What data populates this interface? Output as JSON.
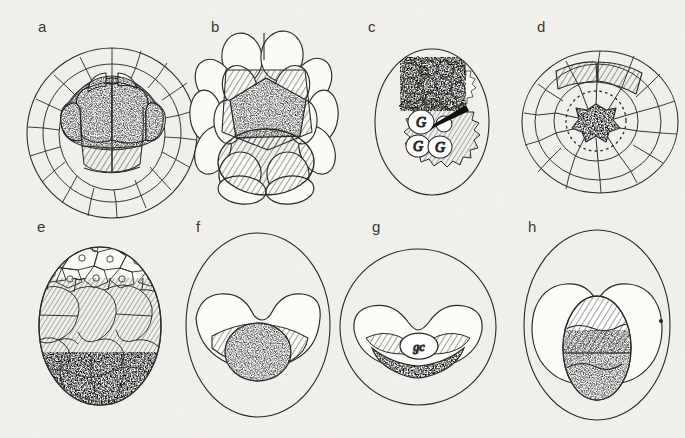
{
  "figure": {
    "background_color": "#f2f0ec",
    "ink_color": "#2b2926",
    "panels": [
      {
        "id": "a",
        "label": "a",
        "label_x": 38,
        "label_y": 32,
        "view": "whole blastula, lateral view",
        "shape": "sphere",
        "cx": 112,
        "cy": 133,
        "rx": 86,
        "ry": 84,
        "features": [
          "outer polygonal blastomere layer",
          "inner stippled cell mass",
          "two hatched cells at base of inner mass"
        ]
      },
      {
        "id": "b",
        "label": "b",
        "label_x": 211,
        "label_y": 32,
        "view": "early cleavage, larger blastomeres",
        "shape": "sphere",
        "cx": 266,
        "cy": 115,
        "rx": 66,
        "ry": 72,
        "features": [
          "ring of large oval blastomeres",
          "hatched inner quadrangle",
          "stippled pentagonal cell",
          "large hatched basal cell"
        ]
      },
      {
        "id": "c",
        "label": "c",
        "label_x": 368,
        "label_y": 32,
        "view": "germ cell cluster within ovoid embryo",
        "shape": "ovoid",
        "cx": 432,
        "cy": 122,
        "rx": 58,
        "ry": 74,
        "features": [
          "spiky hatched cell cluster",
          "stippled upper cells",
          "black arrow indicator"
        ],
        "cell_labels": [
          {
            "text": "G",
            "x": 421,
            "y": 122
          },
          {
            "text": "G",
            "x": 418,
            "y": 145
          },
          {
            "text": "G",
            "x": 438,
            "y": 147
          }
        ],
        "arrow": {
          "x1": 464,
          "y1": 108,
          "x2": 428,
          "y2": 127
        }
      },
      {
        "id": "d",
        "label": "d",
        "label_x": 537,
        "label_y": 32,
        "view": "polar (animal pole) view",
        "shape": "sphere",
        "cx": 600,
        "cy": 122,
        "rx": 78,
        "ry": 72,
        "features": [
          "radial concentric blastomeres",
          "central stippled rosette",
          "dotted circle boundary",
          "two hatched cells at top"
        ]
      },
      {
        "id": "e",
        "label": "e",
        "label_x": 37,
        "label_y": 232,
        "view": "sagittal section, three tissue zones",
        "shape": "ovoid",
        "cx": 100,
        "cy": 326,
        "rx": 62,
        "ry": 80,
        "features": [
          "upper clear polygonal cells with nuclei",
          "middle hatched cell zone",
          "lower stippled yolk-rich zone"
        ]
      },
      {
        "id": "f",
        "label": "f",
        "label_x": 196,
        "label_y": 232,
        "view": "gastrula section, saddle-shaped archenteron",
        "shape": "ovoid",
        "cx": 258,
        "cy": 325,
        "rx": 72,
        "ry": 92,
        "features": [
          "butterfly-shaped inner cavity",
          "hatched band",
          "central stippled germ cell mass"
        ]
      },
      {
        "id": "g",
        "label": "g",
        "label_x": 372,
        "label_y": 232,
        "view": "gastrula section with labelled germ cell",
        "shape": "sphere",
        "cx": 418,
        "cy": 327,
        "rx": 78,
        "ry": 78,
        "features": [
          "chevron-shaped inner cavity",
          "hatched lateral wings",
          "stippled ventral band",
          "clear oval germ cell"
        ],
        "cell_labels": [
          {
            "text": "gc",
            "x": 419,
            "y": 348
          }
        ]
      },
      {
        "id": "h",
        "label": "h",
        "label_x": 528,
        "label_y": 232,
        "view": "later stage, paired lobes with central mass",
        "shape": "ovoid",
        "cx": 597,
        "cy": 325,
        "rx": 73,
        "ry": 95,
        "features": [
          "two rounded inner lobes",
          "central vertical oval",
          "hatched upper half",
          "stippled lower half",
          "small dot on right margin"
        ]
      }
    ]
  }
}
